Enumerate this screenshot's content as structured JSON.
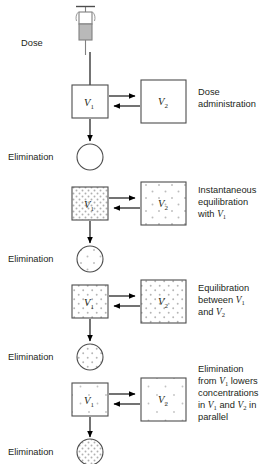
{
  "figure": {
    "dose_label": "Dose",
    "elimination_label": "Elimination",
    "v1_label": "V",
    "v1_sub": "1",
    "v2_label": "V",
    "v2_sub": "2",
    "colors": {
      "stroke": "#4d4d4d",
      "arrow": "#000000",
      "text": "#231f20",
      "stipple": "#b3b3b3",
      "syringe_fill": "#b9b9b9",
      "background": "#ffffff"
    },
    "panels": [
      {
        "id": "panel-dose-administration",
        "caption_lines": [
          "Dose",
          "administration"
        ],
        "caption_plain": "Dose administration",
        "elimination_label": "Elimination",
        "v1_fill": "none",
        "v2_fill": "none",
        "circle_fill": "none",
        "has_syringe": true
      },
      {
        "id": "panel-instantaneous-equilibration",
        "caption_lines": [
          "Instantaneous",
          "equilibration",
          "with V1"
        ],
        "caption_plain": "Instantaneous equilibration with V1",
        "caption_prefix_line3": "with ",
        "elimination_label": "Elimination",
        "v1_fill": "dense",
        "v2_fill": "sparse",
        "circle_fill": "sparse",
        "has_syringe": false
      },
      {
        "id": "panel-equilibration-between",
        "caption_lines": [
          "Equilibration",
          "between V1",
          "and V2"
        ],
        "caption_plain": "Equilibration between V1 and V2",
        "caption_prefix_line2": "between ",
        "caption_prefix_line3": "and ",
        "elimination_label": "Elimination",
        "v1_fill": "medium",
        "v2_fill": "medium",
        "circle_fill": "medium",
        "has_syringe": false
      },
      {
        "id": "panel-elimination-parallel",
        "caption_lines": [
          "Elimination",
          "from V1 lowers",
          "concentrations",
          "in V1 and V2 in",
          "parallel"
        ],
        "caption_plain": "Elimination from V1 lowers concentrations in V1 and V2 in parallel",
        "elimination_label": "Elimination",
        "v1_fill": "light",
        "v2_fill": "light",
        "circle_fill": "dense",
        "has_syringe": false
      }
    ]
  }
}
